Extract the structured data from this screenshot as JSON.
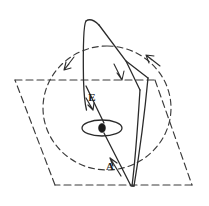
{
  "figure": {
    "width": 209,
    "height": 206,
    "background_color": "#ffffff",
    "stroke_color": "#2b2b2b",
    "dashed_stroke_color": "#3a3a3a",
    "labels": [
      {
        "id": "field-label",
        "text": "E",
        "x": 92,
        "y": 101
      },
      {
        "id": "area-label",
        "text": "A",
        "x": 110,
        "y": 170
      }
    ],
    "elements": {
      "solid_loop": {
        "name": "solid-quadrilateral-loop",
        "description": "narrow solid quadrilateral with apex at top and vertex at bottom",
        "points": "86,21 84,22 83,80 86,110 112,160 130,187 133,186 140,92 148,78 120,48 88,21"
      },
      "dashed_circle": {
        "name": "dashed-circle",
        "description": "large dashed circle with two directional arrowheads",
        "cx": 107,
        "cy": 108,
        "rx": 64,
        "ry": 62
      },
      "dashed_quad": {
        "name": "dashed-quadrilateral-plane",
        "description": "dashed quadrilateral representing a plane surface",
        "points": "15,80 155,80 192,185 55,185 15,80"
      },
      "ellipse_marker": {
        "name": "coil-ellipse",
        "description": "small ellipse with filled dot at center",
        "cx": 102,
        "cy": 128,
        "rx": 20,
        "ry": 8,
        "dot_cx": 102,
        "dot_cy": 128,
        "dot_r": 3
      }
    },
    "arrowheads": [
      {
        "id": "arrow-dashed-left",
        "x": 68,
        "y": 65,
        "angle": 215,
        "style": "open",
        "on": "dashed-circle"
      },
      {
        "id": "arrow-dashed-right",
        "x": 150,
        "y": 58,
        "angle": 305,
        "style": "open",
        "on": "dashed-circle"
      },
      {
        "id": "arrow-solid-diagonal",
        "x": 120,
        "y": 77,
        "angle": 108,
        "style": "open",
        "on": "solid-loop-right-diagonal"
      },
      {
        "id": "arrow-field-line",
        "x": 91,
        "y": 106,
        "angle": 62,
        "style": "open",
        "on": "field-line"
      },
      {
        "id": "arrow-area-line",
        "x": 113,
        "y": 165,
        "angle": 300,
        "style": "open",
        "on": "area-line"
      }
    ]
  }
}
